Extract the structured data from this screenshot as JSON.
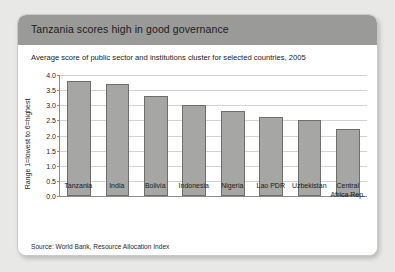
{
  "card": {
    "title": "Tanzania scores high in good governance",
    "subtitle": "Average score of public sector and institutions cluster for selected countries, 2005",
    "source": "Source: World Bank, Resource Allocation Index",
    "header_color": "#9a9a98",
    "bar_color": "#a6a6a4",
    "bar_border_color": "#6e6e6c",
    "grid_color": "#d2d2d0",
    "axis_color": "#8d8d8b"
  },
  "chart_data": {
    "type": "bar",
    "title": "Tanzania scores high in good governance",
    "subtitle": "Average score of public sector and institutions cluster for selected countries, 2005",
    "categories": [
      "Tanzania",
      "India",
      "Bolivia",
      "Indonesia",
      "Nigeria",
      "Lao PDR",
      "Uzbekistan",
      "Central Africa Rep."
    ],
    "values": [
      3.8,
      3.7,
      3.3,
      3.0,
      2.8,
      2.6,
      2.5,
      2.2
    ],
    "xlabel": "",
    "ylabel": "Range 1=lowest to 6=highest",
    "ylim": [
      0.0,
      4.0
    ],
    "ytick_labels": [
      "0.0",
      "0.5",
      "1.0",
      "1.5",
      "2.0",
      "2.5",
      "3.0",
      "3.5",
      "4.0"
    ],
    "ytick_values": [
      0.0,
      0.5,
      1.0,
      1.5,
      2.0,
      2.5,
      3.0,
      3.5,
      4.0
    ],
    "grid": true,
    "legend": false,
    "source": "Source: World Bank, Resource Allocation Index"
  }
}
